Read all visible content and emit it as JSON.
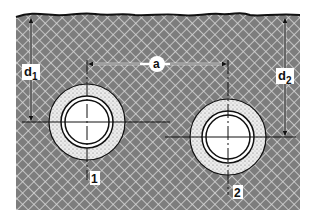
{
  "diagram": {
    "type": "buried pipes cross-section",
    "labels": {
      "horizontal_spacing": "a",
      "depth_pipe1_main": "d",
      "depth_pipe1_sub": "1",
      "depth_pipe2_main": "d",
      "depth_pipe2_sub": "2",
      "pipe1": "1",
      "pipe2": "2"
    },
    "colors": {
      "soil": "#7a7a7a",
      "soil_hatch": "#d8d8d8",
      "surface_line": "#111111",
      "bedding": "#e6e6e6",
      "pipe_interior": "#ffffff",
      "lines": "#111111"
    }
  }
}
